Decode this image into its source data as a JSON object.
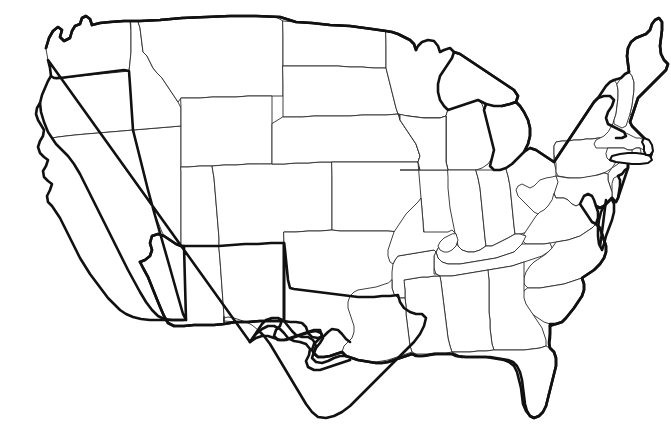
{
  "document": {
    "kind": "map",
    "title": "Blank United States Outline Map",
    "description": "Black-and-white line map of the contiguous United States showing state boundaries with no labels, no legend, and no fill colors.",
    "background_color": "#ffffff",
    "outer_border_color": "#111111",
    "state_border_color": "#2b2b2b",
    "fill_color": "#ffffff",
    "width_px": 671,
    "height_px": 442,
    "projection_hint": "contiguous-48-albers-like",
    "labels_visible": false,
    "legend_visible": false,
    "scale_bar_visible": false,
    "compass_visible": false,
    "graticule_visible": false
  },
  "map": {
    "region": "Contiguous United States",
    "territories_shown": [],
    "states_count": 48,
    "states": [
      {
        "code": "WA",
        "name": "Washington"
      },
      {
        "code": "OR",
        "name": "Oregon"
      },
      {
        "code": "CA",
        "name": "California"
      },
      {
        "code": "NV",
        "name": "Nevada"
      },
      {
        "code": "ID",
        "name": "Idaho"
      },
      {
        "code": "MT",
        "name": "Montana"
      },
      {
        "code": "WY",
        "name": "Wyoming"
      },
      {
        "code": "UT",
        "name": "Utah"
      },
      {
        "code": "AZ",
        "name": "Arizona"
      },
      {
        "code": "NM",
        "name": "New Mexico"
      },
      {
        "code": "CO",
        "name": "Colorado"
      },
      {
        "code": "ND",
        "name": "North Dakota"
      },
      {
        "code": "SD",
        "name": "South Dakota"
      },
      {
        "code": "NE",
        "name": "Nebraska"
      },
      {
        "code": "KS",
        "name": "Kansas"
      },
      {
        "code": "OK",
        "name": "Oklahoma"
      },
      {
        "code": "TX",
        "name": "Texas"
      },
      {
        "code": "MN",
        "name": "Minnesota"
      },
      {
        "code": "IA",
        "name": "Iowa"
      },
      {
        "code": "MO",
        "name": "Missouri"
      },
      {
        "code": "AR",
        "name": "Arkansas"
      },
      {
        "code": "LA",
        "name": "Louisiana"
      },
      {
        "code": "WI",
        "name": "Wisconsin"
      },
      {
        "code": "IL",
        "name": "Illinois"
      },
      {
        "code": "MI",
        "name": "Michigan"
      },
      {
        "code": "IN",
        "name": "Indiana"
      },
      {
        "code": "OH",
        "name": "Ohio"
      },
      {
        "code": "KY",
        "name": "Kentucky"
      },
      {
        "code": "TN",
        "name": "Tennessee"
      },
      {
        "code": "MS",
        "name": "Mississippi"
      },
      {
        "code": "AL",
        "name": "Alabama"
      },
      {
        "code": "GA",
        "name": "Georgia"
      },
      {
        "code": "FL",
        "name": "Florida"
      },
      {
        "code": "SC",
        "name": "South Carolina"
      },
      {
        "code": "NC",
        "name": "North Carolina"
      },
      {
        "code": "VA",
        "name": "Virginia"
      },
      {
        "code": "WV",
        "name": "West Virginia"
      },
      {
        "code": "MD",
        "name": "Maryland"
      },
      {
        "code": "DE",
        "name": "Delaware"
      },
      {
        "code": "PA",
        "name": "Pennsylvania"
      },
      {
        "code": "NJ",
        "name": "New Jersey"
      },
      {
        "code": "NY",
        "name": "New York"
      },
      {
        "code": "CT",
        "name": "Connecticut"
      },
      {
        "code": "RI",
        "name": "Rhode Island"
      },
      {
        "code": "MA",
        "name": "Massachusetts"
      },
      {
        "code": "VT",
        "name": "Vermont"
      },
      {
        "code": "NH",
        "name": "New Hampshire"
      },
      {
        "code": "ME",
        "name": "Maine"
      }
    ]
  }
}
